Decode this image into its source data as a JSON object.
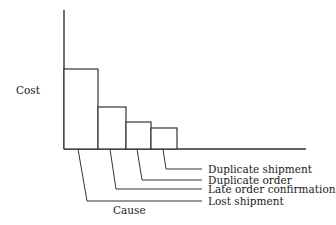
{
  "chart_data": {
    "type": "bar",
    "title": "",
    "xlabel": "Cause",
    "ylabel": "Cost",
    "categories": [
      "Lost shipment",
      "Late order confirmation",
      "Duplicate order",
      "Duplicate shipment"
    ],
    "values": [
      80,
      42,
      27,
      21
    ],
    "value_units": "relative (no numeric scale shown)",
    "ylim": [
      0,
      139
    ],
    "grid": false,
    "legend": null,
    "layout": {
      "style": "pareto",
      "bars_adjacent": true,
      "category_labels": "leader-lines to right-side labels",
      "y_ticks": false,
      "x_ticks": false
    },
    "colors": {
      "line": "#333333",
      "fill": "#ffffff",
      "text": "#1a1a1a"
    }
  }
}
